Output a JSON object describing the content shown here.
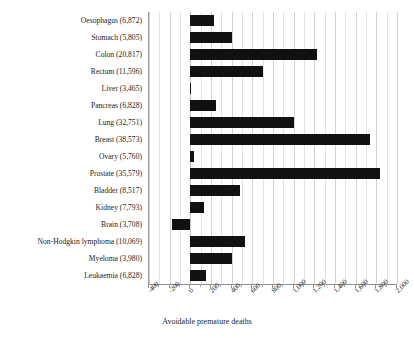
{
  "chart_data": {
    "type": "bar",
    "orientation": "horizontal",
    "title": "",
    "xlabel": "Avoidable premature deaths",
    "ylabel": "",
    "xlim": [
      -400,
      2000
    ],
    "xticks": [
      -400,
      -200,
      0,
      200,
      400,
      600,
      800,
      1000,
      1200,
      1400,
      1600,
      1800,
      2000
    ],
    "xtick_labels": [
      "-400",
      "-200",
      "0",
      "200",
      "400",
      "600",
      "800",
      "1,000",
      "1,200",
      "1,400",
      "1,600",
      "1,800",
      "2,000"
    ],
    "grid": true,
    "legend": null,
    "bar_color": "#111111",
    "categories": [
      "Oesophagus (6,872)",
      "Stomach (5,805)",
      "Colon (20,817)",
      "Rectum (11,596)",
      "Liver (3,465)",
      "Pancreas (6,828)",
      "Lung (32,751)",
      "Breast (38,573)",
      "Ovary (5,760)",
      "Prostate (35,579)",
      "Bladder (8,517)",
      "Kidney (7,793)",
      "Brain (3,708)",
      "Non-Hodgkin lymphoma (10,069)",
      "Myeloma (3,980)",
      "Leukaemia (6,828)"
    ],
    "values": [
      230,
      400,
      1230,
      700,
      10,
      250,
      1000,
      1740,
      40,
      1840,
      480,
      130,
      -180,
      530,
      400,
      150
    ]
  }
}
